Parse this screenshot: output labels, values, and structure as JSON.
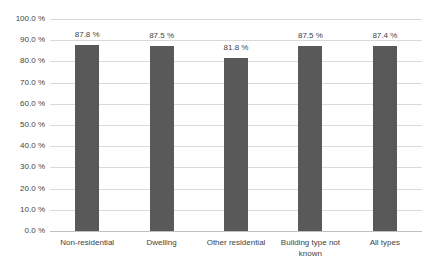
{
  "chart_data": {
    "type": "bar",
    "title": "",
    "xlabel": "",
    "ylabel": "",
    "categories": [
      "Non-residential",
      "Dwelling",
      "Other residential",
      "Building type not known",
      "All types"
    ],
    "values": [
      87.8,
      87.5,
      81.8,
      87.5,
      87.4
    ],
    "data_labels": [
      "87.8 %",
      "87.5 %",
      "81.8 %",
      "87.5 %",
      "87.4 %"
    ],
    "y_ticks": [
      "100.0 %",
      "90.0 %",
      "80.0 %",
      "70.0 %",
      "60.0 %",
      "50.0 %",
      "40.0 %",
      "30.0 %",
      "20.0 %",
      "10.0 %",
      "0.0 %"
    ],
    "ylim": [
      0,
      100
    ],
    "y_tick_step": 10,
    "grid": true,
    "legend_position": "none",
    "colors": {
      "bar": "#595959",
      "gridline": "#d9d9d9",
      "axis_line": "#c0c0c0",
      "text": "#3f3f3f",
      "background": "#ffffff"
    }
  }
}
